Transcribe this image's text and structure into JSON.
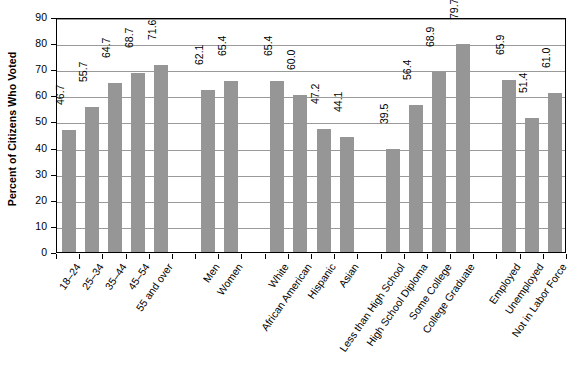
{
  "chart_data": {
    "type": "bar",
    "title": "",
    "xlabel": "",
    "ylabel": "Percent of Citizens Who Voted",
    "ylim": [
      0,
      90
    ],
    "ytick_values": [
      0,
      10,
      20,
      30,
      40,
      50,
      60,
      70,
      80,
      90
    ],
    "ytick_labels": [
      "0",
      "10",
      "20",
      "30",
      "40",
      "50",
      "60",
      "70",
      "80",
      "90"
    ],
    "grid": true,
    "legend": "none",
    "bar_color": "#969696",
    "categories": [
      "18–24",
      "25–34",
      "35–44",
      "45–54",
      "55 and over",
      "Men",
      "Women",
      "White",
      "African American",
      "Hispanic",
      "Asian",
      "Less than High School",
      "High School Diploma",
      "Some College",
      "College Graduate",
      "Employed",
      "Unemployed",
      "Not in Labor Force"
    ],
    "values": [
      46.7,
      55.7,
      64.7,
      68.7,
      71.6,
      62.1,
      65.4,
      65.4,
      60.0,
      47.2,
      44.1,
      39.5,
      56.4,
      68.9,
      79.7,
      65.9,
      51.4,
      61.0
    ],
    "value_labels": [
      "46.7",
      "55.7",
      "64.7",
      "68.7",
      "71.6",
      "62.1",
      "65.4",
      "65.4",
      "60.0",
      "47.2",
      "44.1",
      "39.5",
      "56.4",
      "68.9",
      "79.7",
      "65.9",
      "51.4",
      "61.0"
    ],
    "groups": [
      {
        "name": "Age",
        "count": 5
      },
      {
        "name": "Gender",
        "count": 2
      },
      {
        "name": "Race/Ethnicity",
        "count": 4
      },
      {
        "name": "Education",
        "count": 4
      },
      {
        "name": "Labor Force Status",
        "count": 3
      }
    ],
    "slot_count": 22,
    "gap_slots": [
      5,
      8,
      13,
      18
    ]
  }
}
